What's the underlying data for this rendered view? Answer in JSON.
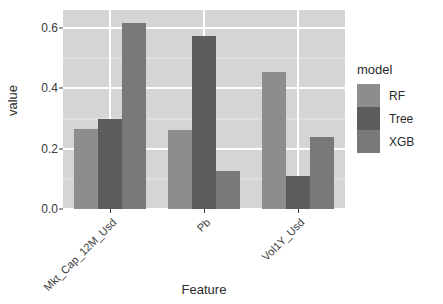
{
  "chart_data": {
    "type": "bar",
    "title": "",
    "xlabel": "Feature",
    "ylabel": "value",
    "categories": [
      "Mkt_Cap_12M_Usd",
      "Pb",
      "Vol1Y_Usd"
    ],
    "series": [
      {
        "name": "RF",
        "color": "#8d8d8d",
        "values": [
          0.265,
          0.263,
          0.455
        ]
      },
      {
        "name": "Tree",
        "color": "#5c5c5c",
        "values": [
          0.297,
          0.575,
          0.11
        ]
      },
      {
        "name": "XGB",
        "color": "#797979",
        "values": [
          0.618,
          0.127,
          0.24
        ]
      }
    ],
    "ylim": [
      0.0,
      0.66
    ],
    "yticks": [
      0.0,
      0.2,
      0.4,
      0.6
    ],
    "ytick_labels": [
      "0.0",
      "0.2",
      "0.4",
      "0.6"
    ],
    "yminor": [
      0.1,
      0.3,
      0.5
    ],
    "grid": true,
    "legend": {
      "title": "model",
      "position": "right"
    },
    "panel_background": "#d5d5d5",
    "grid_color": "#ffffff"
  }
}
